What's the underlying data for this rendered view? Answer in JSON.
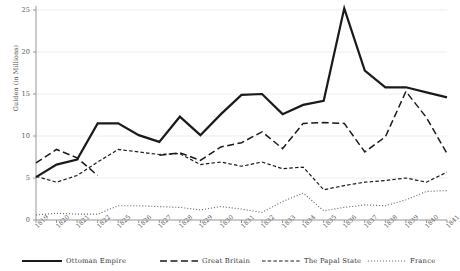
{
  "title": "",
  "chart_data": {
    "type": "line",
    "title": "",
    "xlabel": "",
    "ylabel": "Gulden (in Millions)",
    "ylim": [
      0,
      25
    ],
    "yticks": [
      0,
      5,
      10,
      15,
      20,
      25
    ],
    "grid": "horizontal",
    "legend_position": "bottom",
    "categories": [
      "1819",
      "1820",
      "1821",
      "1822",
      "1823",
      "1826",
      "1827",
      "1828",
      "1829",
      "1830",
      "1831",
      "1832",
      "1833",
      "1834",
      "1835",
      "1836",
      "1837",
      "1838",
      "1839",
      "1840",
      "1841"
    ],
    "x": [
      "1819",
      "1820",
      "1821",
      "1822",
      "1825",
      "1826",
      "1827",
      "1828",
      "1829",
      "1830",
      "1831",
      "1832",
      "1833",
      "1834",
      "1835",
      "1836",
      "1837",
      "1838",
      "1839",
      "1840",
      "1841"
    ],
    "series": [
      {
        "name": "Ottoman Empire",
        "style": "solid",
        "width": 2.2,
        "color": "#1a1a1a",
        "values": [
          5.1,
          6.6,
          7.2,
          11.5,
          11.5,
          10.1,
          9.3,
          12.3,
          10.1,
          12.6,
          14.9,
          15.0,
          12.6,
          13.7,
          14.2,
          25.2,
          17.8,
          15.8,
          15.8,
          15.2,
          14.6
        ]
      },
      {
        "name": "Great Britain",
        "style": "longdash",
        "width": 1.5,
        "color": "#1a1a1a",
        "values": [
          6.8,
          8.4,
          7.4,
          5.3,
          null,
          null,
          7.7,
          8.0,
          7.1,
          8.7,
          9.2,
          10.5,
          8.5,
          11.5,
          11.6,
          11.5,
          8.1,
          9.9,
          15.3,
          12.2,
          7.9
        ]
      },
      {
        "name": "The Papal State",
        "style": "shortdash",
        "width": 1.2,
        "color": "#1a1a1a",
        "values": [
          5.2,
          4.5,
          5.3,
          6.9,
          8.4,
          8.1,
          7.8,
          7.9,
          6.6,
          6.9,
          6.4,
          6.9,
          6.1,
          6.3,
          3.6,
          4.1,
          4.5,
          4.7,
          5.0,
          4.5,
          5.7
        ]
      },
      {
        "name": "France",
        "style": "dotted",
        "width": 1.1,
        "color": "#6a6a6a",
        "values": [
          0.6,
          0.8,
          0.7,
          0.7,
          1.7,
          1.7,
          1.6,
          1.5,
          1.2,
          1.6,
          1.3,
          0.9,
          2.2,
          3.2,
          1.1,
          1.5,
          1.8,
          1.7,
          2.4,
          3.4,
          3.5
        ]
      }
    ],
    "series_tail_france": [
      2.9,
      2.2
    ]
  },
  "legend": {
    "items": [
      {
        "label": "Ottoman Empire",
        "style": "solid"
      },
      {
        "label": "Great Britain",
        "style": "longdash"
      },
      {
        "label": "The Papal State",
        "style": "shortdash"
      },
      {
        "label": "France",
        "style": "dotted"
      }
    ]
  }
}
